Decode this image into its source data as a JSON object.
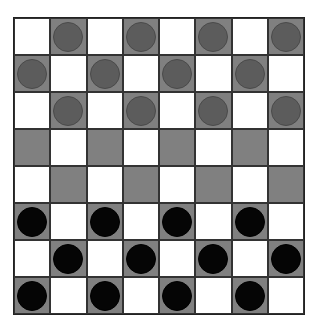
{
  "board": {
    "rows": 8,
    "cols": 8,
    "colors": {
      "light_square": "#ffffff",
      "dark_square": "#808080",
      "gray_piece": "#5c5c5c",
      "black_piece": "#050505"
    },
    "layout": [
      [
        ".",
        "g",
        ".",
        "g",
        ".",
        "g",
        ".",
        "g"
      ],
      [
        "g",
        ".",
        "g",
        ".",
        "g",
        ".",
        "g",
        "."
      ],
      [
        ".",
        "g",
        ".",
        "g",
        ".",
        "g",
        ".",
        "g"
      ],
      [
        ".",
        ".",
        ".",
        ".",
        ".",
        ".",
        ".",
        "."
      ],
      [
        ".",
        ".",
        ".",
        ".",
        ".",
        ".",
        ".",
        "."
      ],
      [
        "b",
        ".",
        "b",
        ".",
        "b",
        ".",
        "b",
        "."
      ],
      [
        ".",
        "b",
        ".",
        "b",
        ".",
        "b",
        ".",
        "b"
      ],
      [
        "b",
        ".",
        "b",
        ".",
        "b",
        ".",
        "b",
        "."
      ]
    ]
  }
}
